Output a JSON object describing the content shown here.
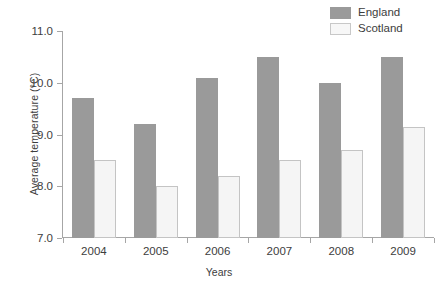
{
  "chart_data": {
    "type": "bar",
    "title": "",
    "xlabel": "Years",
    "ylabel": "Average temperature (°C)",
    "categories": [
      "2004",
      "2005",
      "2006",
      "2007",
      "2008",
      "2009"
    ],
    "series": [
      {
        "name": "England",
        "color": "#9a9a9a",
        "values": [
          9.7,
          9.2,
          10.1,
          10.5,
          10.0,
          10.5
        ]
      },
      {
        "name": "Scotland",
        "color": "#f5f5f5",
        "values": [
          8.5,
          8.0,
          8.2,
          8.5,
          8.7,
          9.15
        ]
      }
    ],
    "ylim": [
      7.0,
      11.0
    ],
    "yticks": [
      "7.0",
      "8.0",
      "9.0",
      "10.0",
      "11.0"
    ],
    "ytick_values": [
      7.0,
      8.0,
      9.0,
      10.0,
      11.0
    ],
    "grid": false,
    "legend_position": "top-right"
  },
  "legend": {
    "items": [
      {
        "label": "England",
        "swatch": "england"
      },
      {
        "label": "Scotland",
        "swatch": "scotland"
      }
    ]
  }
}
